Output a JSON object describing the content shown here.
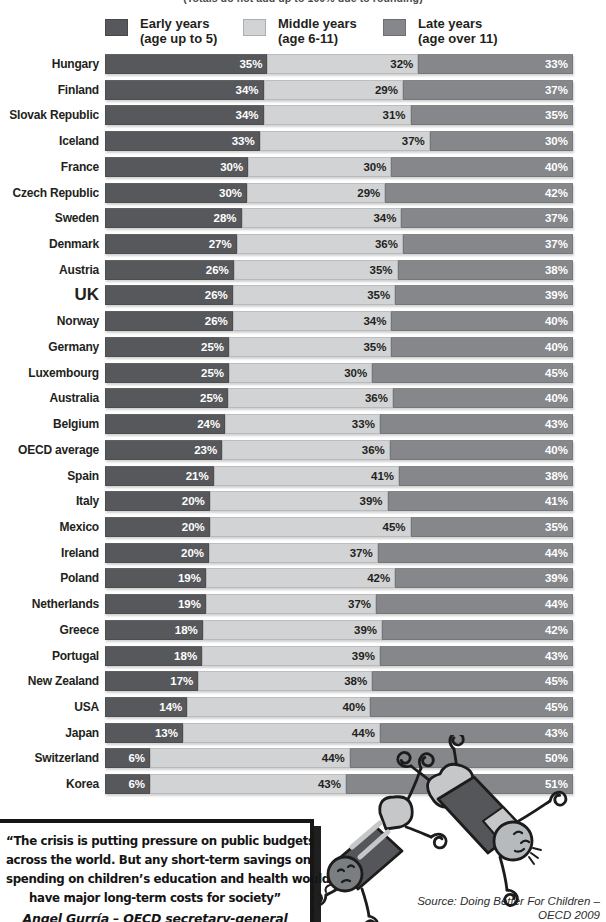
{
  "note_top": "(Totals do not add up to 100% due to rounding)",
  "legend": [
    {
      "label": "Early years",
      "sublabel": "(age up to 5)",
      "color": "#57585B"
    },
    {
      "label": "Middle years",
      "sublabel": "(age 6-11)",
      "color": "#D2D3D5"
    },
    {
      "label": "Late years",
      "sublabel": "(age over 11)",
      "color": "#85878A"
    }
  ],
  "highlight_category": "UK",
  "chart_data": {
    "type": "bar",
    "stacked": true,
    "orientation": "horizontal",
    "value_suffix": "%",
    "categories": [
      "Hungary",
      "Finland",
      "Slovak Republic",
      "Iceland",
      "France",
      "Czech Republic",
      "Sweden",
      "Denmark",
      "Austria",
      "UK",
      "Norway",
      "Germany",
      "Luxembourg",
      "Australia",
      "Belgium",
      "OECD average",
      "Spain",
      "Italy",
      "Mexico",
      "Ireland",
      "Poland",
      "Netherlands",
      "Greece",
      "Portugal",
      "New Zealand",
      "USA",
      "Japan",
      "Switzerland",
      "Korea"
    ],
    "series": [
      {
        "key": "early",
        "name": "Early years (age up to 5)",
        "color": "#57585B",
        "label_color": "#FFFFFF",
        "values": [
          35,
          34,
          34,
          33,
          30,
          30,
          28,
          27,
          26,
          26,
          26,
          25,
          25,
          25,
          24,
          23,
          21,
          20,
          20,
          20,
          19,
          19,
          18,
          18,
          17,
          14,
          13,
          6,
          6
        ]
      },
      {
        "key": "middle",
        "name": "Middle years (age 6-11)",
        "color": "#D2D3D5",
        "label_color": "#231F20",
        "values": [
          32,
          29,
          31,
          37,
          30,
          29,
          34,
          36,
          35,
          35,
          34,
          35,
          30,
          36,
          33,
          36,
          41,
          39,
          45,
          37,
          42,
          37,
          39,
          39,
          38,
          40,
          44,
          44,
          43
        ]
      },
      {
        "key": "late",
        "name": "Late years (age over 11)",
        "color": "#85878A",
        "label_color": "#FFFFFF",
        "values": [
          33,
          37,
          35,
          30,
          40,
          42,
          37,
          37,
          38,
          39,
          40,
          40,
          45,
          40,
          43,
          40,
          38,
          41,
          35,
          44,
          39,
          44,
          42,
          43,
          45,
          45,
          43,
          50,
          51
        ]
      }
    ]
  },
  "quote": {
    "lines": [
      "“The crisis is putting pressure on public budgets",
      "across the world. But any short-term savings on",
      "spending on children’s education and health would",
      "have major long-term costs for society”"
    ],
    "attribution": "Angel Gurría  – OECD secretary-general"
  },
  "source": {
    "line1": "Source: Doing Better For Children –",
    "line2": "OECD 2009"
  }
}
